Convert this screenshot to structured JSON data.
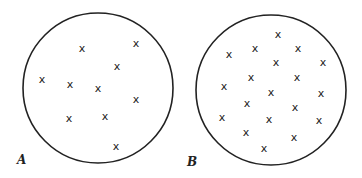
{
  "figure": {
    "panels": [
      {
        "label": "A",
        "circle": {
          "cx": 98,
          "cy": 88,
          "r": 75
        },
        "label_pos": {
          "x": 17,
          "y": 164
        },
        "marker": "x",
        "points": [
          [
            82,
            48
          ],
          [
            136,
            43
          ],
          [
            117,
            66
          ],
          [
            42,
            79
          ],
          [
            70,
            84
          ],
          [
            98,
            88
          ],
          [
            136,
            99
          ],
          [
            69,
            118
          ],
          [
            105,
            116
          ],
          [
            116,
            146
          ]
        ]
      },
      {
        "label": "B",
        "circle": {
          "cx": 271,
          "cy": 90,
          "r": 75
        },
        "label_pos": {
          "x": 187,
          "y": 166
        },
        "marker": "x",
        "points": [
          [
            278,
            34
          ],
          [
            255,
            48
          ],
          [
            298,
            48
          ],
          [
            229,
            54
          ],
          [
            276,
            62
          ],
          [
            323,
            62
          ],
          [
            251,
            77
          ],
          [
            297,
            77
          ],
          [
            224,
            86
          ],
          [
            271,
            92
          ],
          [
            321,
            93
          ],
          [
            247,
            103
          ],
          [
            295,
            107
          ],
          [
            222,
            117
          ],
          [
            269,
            119
          ],
          [
            319,
            120
          ],
          [
            246,
            132
          ],
          [
            294,
            137
          ],
          [
            264,
            148
          ]
        ]
      }
    ],
    "colors": {
      "stroke": "#222222",
      "background": "#ffffff"
    }
  }
}
